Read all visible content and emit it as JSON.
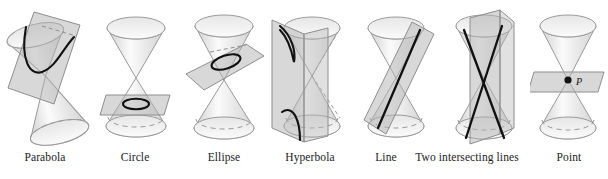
{
  "figure": {
    "background_color": "#ffffff",
    "cone_outline_color": "#9a9a9a",
    "cone_fill_light": "#fcfcfc",
    "cone_fill_dark": "#cfcfcf",
    "plane_fill_color": "#b4b4b4",
    "plane_outline_color": "#8e8e8e",
    "curve_color": "#111111",
    "hidden_edge_style": "dashed"
  },
  "panels": [
    {
      "id": "parabola",
      "label": "Parabola",
      "intersection_type": "parabola",
      "plane_orientation": "tilted parallel to one generator",
      "cone_orientation": "tilted double cone",
      "curve_count": 1
    },
    {
      "id": "circle",
      "label": "Circle",
      "intersection_type": "circle",
      "plane_orientation": "horizontal, perpendicular to axis",
      "cone_orientation": "vertical double cone",
      "curve_count": 1
    },
    {
      "id": "ellipse",
      "label": "Ellipse",
      "intersection_type": "ellipse",
      "plane_orientation": "oblique, cutting one nappe",
      "cone_orientation": "vertical double cone",
      "curve_count": 1
    },
    {
      "id": "hyperbola",
      "label": "Hyperbola",
      "intersection_type": "hyperbola",
      "plane_orientation": "vertical, cutting both nappes",
      "cone_orientation": "vertical double cone",
      "curve_count": 2
    },
    {
      "id": "line",
      "label": "Line",
      "intersection_type": "single line",
      "plane_orientation": "tangent plane along one generator",
      "cone_orientation": "vertical double cone",
      "curve_count": 1
    },
    {
      "id": "two-intersecting-lines",
      "label": "Two intersecting lines",
      "intersection_type": "two intersecting lines",
      "plane_orientation": "vertical plane through the apex",
      "cone_orientation": "vertical double cone",
      "curve_count": 2
    },
    {
      "id": "point",
      "label": "Point",
      "intersection_type": "point",
      "plane_orientation": "horizontal plane through the apex",
      "cone_orientation": "vertical double cone",
      "curve_count": 0,
      "point_label": "P"
    }
  ]
}
